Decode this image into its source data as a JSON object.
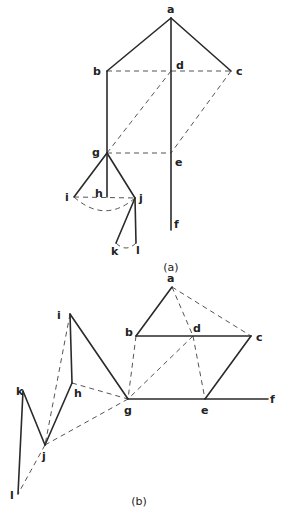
{
  "panels": [
    {
      "caption": "(a)",
      "nodes": {
        "a": {
          "label": "a",
          "x": 171,
          "y": 18,
          "lx": 167,
          "ly": 13
        },
        "b": {
          "label": "b",
          "x": 107,
          "y": 71,
          "lx": 93,
          "ly": 75
        },
        "d": {
          "label": "d",
          "x": 171,
          "y": 71,
          "lx": 176,
          "ly": 69
        },
        "c": {
          "label": "c",
          "x": 231,
          "y": 71,
          "lx": 236,
          "ly": 75
        },
        "g": {
          "label": "g",
          "x": 107,
          "y": 153,
          "lx": 92,
          "ly": 156
        },
        "e": {
          "label": "e",
          "x": 171,
          "y": 153,
          "lx": 175,
          "ly": 166
        },
        "f": {
          "label": "f",
          "x": 171,
          "y": 230,
          "lx": 174,
          "ly": 228
        },
        "h": {
          "label": "h",
          "x": 107,
          "y": 197,
          "lx": 95,
          "ly": 197
        },
        "i": {
          "label": "i",
          "x": 74,
          "y": 197,
          "lx": 65,
          "ly": 201
        },
        "j": {
          "label": "j",
          "x": 135,
          "y": 198,
          "lx": 139,
          "ly": 202
        },
        "k": {
          "label": "k",
          "x": 116,
          "y": 243,
          "lx": 111,
          "ly": 255
        },
        "l": {
          "label": "l",
          "x": 136,
          "y": 243,
          "lx": 136,
          "ly": 254
        }
      },
      "solid_edges": [
        [
          "a",
          "b"
        ],
        [
          "a",
          "c"
        ],
        [
          "a",
          "f"
        ],
        [
          "b",
          "g"
        ],
        [
          "g",
          "i"
        ],
        [
          "g",
          "h"
        ],
        [
          "g",
          "j"
        ],
        [
          "j",
          "k"
        ],
        [
          "j",
          "l"
        ]
      ],
      "dashed_edges": [
        [
          "b",
          "d"
        ],
        [
          "d",
          "c"
        ],
        [
          "d",
          "g"
        ],
        [
          "c",
          "e"
        ],
        [
          "g",
          "e"
        ],
        [
          "i",
          "j"
        ]
      ],
      "dashed_curves": [
        [
          "i",
          "j"
        ],
        [
          "k",
          "l"
        ]
      ]
    },
    {
      "caption": "(b)",
      "nodes": {
        "a": {
          "label": "a",
          "x": 172,
          "y": 287,
          "lx": 167,
          "ly": 282
        },
        "b": {
          "label": "b",
          "x": 136,
          "y": 336,
          "lx": 125,
          "ly": 336
        },
        "d": {
          "label": "d",
          "x": 193,
          "y": 336,
          "lx": 193,
          "ly": 332
        },
        "c": {
          "label": "c",
          "x": 251,
          "y": 336,
          "lx": 256,
          "ly": 341
        },
        "g": {
          "label": "g",
          "x": 128,
          "y": 399,
          "lx": 124,
          "ly": 414
        },
        "e": {
          "label": "e",
          "x": 205,
          "y": 399,
          "lx": 201,
          "ly": 414
        },
        "f": {
          "label": "f",
          "x": 268,
          "y": 399,
          "lx": 270,
          "ly": 403
        },
        "i": {
          "label": "i",
          "x": 70,
          "y": 314,
          "lx": 57,
          "ly": 319
        },
        "h": {
          "label": "h",
          "x": 72,
          "y": 383,
          "lx": 74,
          "ly": 397
        },
        "k": {
          "label": "k",
          "x": 23,
          "y": 391,
          "lx": 16,
          "ly": 395
        },
        "j": {
          "label": "j",
          "x": 45,
          "y": 445,
          "lx": 42,
          "ly": 460
        },
        "l": {
          "label": "l",
          "x": 18,
          "y": 494,
          "lx": 10,
          "ly": 499
        }
      },
      "solid_edges": [
        [
          "a",
          "b"
        ],
        [
          "b",
          "c"
        ],
        [
          "c",
          "e"
        ],
        [
          "g",
          "f"
        ],
        [
          "i",
          "g"
        ],
        [
          "i",
          "h"
        ],
        [
          "h",
          "j"
        ],
        [
          "j",
          "k"
        ],
        [
          "k",
          "l"
        ]
      ],
      "dashed_edges": [
        [
          "a",
          "d"
        ],
        [
          "a",
          "c"
        ],
        [
          "d",
          "e"
        ],
        [
          "d",
          "g"
        ],
        [
          "b",
          "g"
        ],
        [
          "h",
          "g"
        ],
        [
          "i",
          "j"
        ],
        [
          "j",
          "g"
        ],
        [
          "j",
          "l"
        ]
      ]
    }
  ],
  "panel_captions": {
    "a": "(a)",
    "b": "(b)"
  },
  "caption_positions": {
    "a": {
      "x": 171,
      "y": 271
    },
    "b": {
      "x": 139,
      "y": 505
    }
  }
}
